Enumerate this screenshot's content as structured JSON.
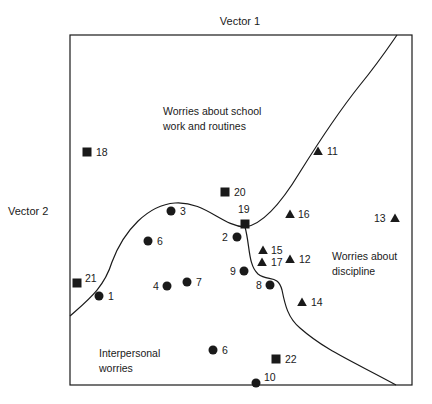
{
  "axes": {
    "vector1": "Vector 1",
    "vector2": "Vector 2"
  },
  "regions": {
    "school": [
      "Worries about school",
      "work and routines"
    ],
    "discipline": [
      "Worries about",
      "discipline"
    ],
    "interpersonal": [
      "Interpersonal",
      "worries"
    ]
  },
  "legend_shapes": {
    "circle": "circle-marker",
    "square": "square-marker",
    "triangle": "triangle-marker"
  },
  "points": [
    {
      "id": "1",
      "shape": "circle",
      "x": 99,
      "y": 296,
      "label": "1",
      "lx": 108,
      "ly": 300
    },
    {
      "id": "2",
      "shape": "circle",
      "x": 237,
      "y": 237,
      "label": "2",
      "lx": 222,
      "ly": 241
    },
    {
      "id": "3",
      "shape": "circle",
      "x": 171,
      "y": 211,
      "label": "3",
      "lx": 180,
      "ly": 215
    },
    {
      "id": "4",
      "shape": "circle",
      "x": 167,
      "y": 286,
      "label": "4",
      "lx": 153,
      "ly": 290
    },
    {
      "id": "6a",
      "shape": "circle",
      "x": 148,
      "y": 241,
      "label": "6",
      "lx": 157,
      "ly": 245
    },
    {
      "id": "6b",
      "shape": "circle",
      "x": 213,
      "y": 350,
      "label": "6",
      "lx": 222,
      "ly": 354
    },
    {
      "id": "7",
      "shape": "circle",
      "x": 187,
      "y": 282,
      "label": "7",
      "lx": 196,
      "ly": 286
    },
    {
      "id": "8",
      "shape": "circle",
      "x": 270,
      "y": 285,
      "label": "8",
      "lx": 256,
      "ly": 289
    },
    {
      "id": "9",
      "shape": "circle",
      "x": 244,
      "y": 271,
      "label": "9",
      "lx": 230,
      "ly": 275
    },
    {
      "id": "10",
      "shape": "circle",
      "x": 256,
      "y": 383,
      "label": "10",
      "lx": 264,
      "ly": 381
    },
    {
      "id": "11",
      "shape": "triangle",
      "x": 318,
      "y": 151,
      "label": "11",
      "lx": 327,
      "ly": 155
    },
    {
      "id": "12",
      "shape": "triangle",
      "x": 290,
      "y": 259,
      "label": "12",
      "lx": 299,
      "ly": 263
    },
    {
      "id": "13",
      "shape": "triangle",
      "x": 395,
      "y": 218,
      "label": "13",
      "lx": 374,
      "ly": 222
    },
    {
      "id": "14",
      "shape": "triangle",
      "x": 302,
      "y": 302,
      "label": "14",
      "lx": 311,
      "ly": 306
    },
    {
      "id": "15",
      "shape": "triangle",
      "x": 263,
      "y": 250,
      "label": "15",
      "lx": 271,
      "ly": 254
    },
    {
      "id": "16",
      "shape": "triangle",
      "x": 290,
      "y": 214,
      "label": "16",
      "lx": 298,
      "ly": 218
    },
    {
      "id": "17",
      "shape": "triangle",
      "x": 262,
      "y": 262,
      "label": "17",
      "lx": 271,
      "ly": 266
    },
    {
      "id": "18",
      "shape": "square",
      "x": 87,
      "y": 152,
      "label": "18",
      "lx": 96,
      "ly": 156
    },
    {
      "id": "19",
      "shape": "square",
      "x": 245,
      "y": 224,
      "label": "19",
      "lx": 238,
      "ly": 213
    },
    {
      "id": "20",
      "shape": "square",
      "x": 225,
      "y": 192,
      "label": "20",
      "lx": 234,
      "ly": 196
    },
    {
      "id": "21",
      "shape": "square",
      "x": 77,
      "y": 283,
      "label": "21",
      "lx": 85,
      "ly": 282
    },
    {
      "id": "22",
      "shape": "square",
      "x": 276,
      "y": 359,
      "label": "22",
      "lx": 285,
      "ly": 363
    }
  ],
  "colors": {
    "ink": "#1a1a1a",
    "background": "#ffffff"
  }
}
